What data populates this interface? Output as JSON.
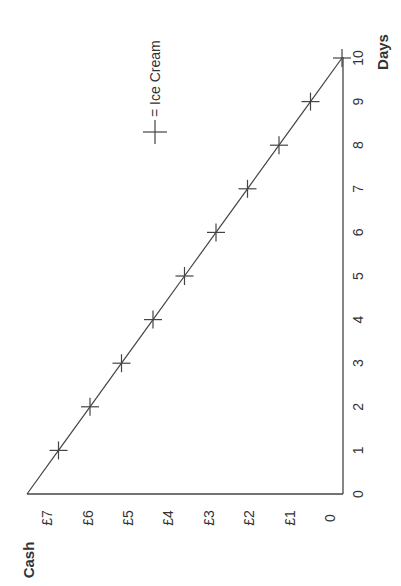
{
  "chart_data": {
    "type": "line",
    "orientation": "rotated-90",
    "title": "",
    "xlabel": "Days",
    "ylabel": "Cash",
    "x": [
      0,
      1,
      2,
      3,
      4,
      5,
      6,
      7,
      8,
      9,
      10
    ],
    "series": [
      {
        "name": "Ice Cream",
        "marker": "+",
        "values": [
          7.5,
          6.75,
          6.0,
          5.25,
          4.5,
          3.75,
          3.0,
          2.25,
          1.5,
          0.75,
          0.0
        ]
      }
    ],
    "x_ticks": [
      "0",
      "1",
      "2",
      "3",
      "4",
      "5",
      "6",
      "7",
      "8",
      "9",
      "10"
    ],
    "y_ticks": [
      "0",
      "£1",
      "£2",
      "£3",
      "£4",
      "£5",
      "£6",
      "£7"
    ],
    "xlim": [
      0,
      10
    ],
    "ylim": [
      0,
      7.5
    ],
    "grid": false,
    "legend": {
      "position": "upper-right",
      "entries": [
        "+ = Ice Cream"
      ]
    }
  },
  "labels": {
    "x_axis_title": "Days",
    "y_axis_title": "Cash",
    "legend_text": "= Ice Cream",
    "x_ticks": [
      "0",
      "1",
      "2",
      "3",
      "4",
      "5",
      "6",
      "7",
      "8",
      "9",
      "10"
    ],
    "y_ticks": [
      "0",
      "£1",
      "£2",
      "£3",
      "£4",
      "£5",
      "£6",
      "£7"
    ]
  }
}
